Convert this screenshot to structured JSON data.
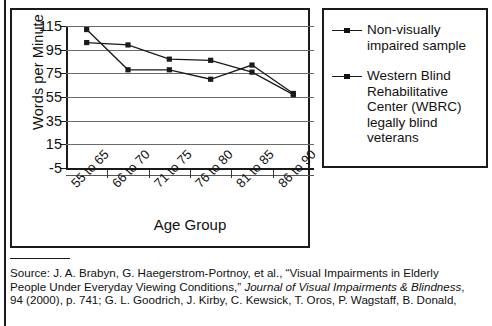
{
  "chart_data": {
    "type": "line",
    "title": "",
    "xlabel": "Age Group",
    "ylabel": "Words per Minute",
    "categories": [
      "55 to 65",
      "66 to 70",
      "71 to 75",
      "76 to 80",
      "81 to 85",
      "86 to 90"
    ],
    "yticks": [
      115,
      95,
      75,
      55,
      35,
      15,
      -5
    ],
    "ylim": [
      -5,
      115
    ],
    "grid": true,
    "legend_position": "right",
    "series": [
      {
        "name": "Non-visually impaired sample",
        "values": [
          112,
          78,
          78,
          70,
          82,
          58
        ]
      },
      {
        "name": "Western Blind Rehabilitative Center (WBRC) legally blind veterans",
        "values": [
          101,
          99,
          87,
          86,
          76,
          57
        ]
      }
    ]
  },
  "chart": {
    "y_axis_title": "Words per Minute",
    "x_axis_title": "Age Group",
    "y_tick_labels": [
      "115",
      "95",
      "75",
      "55",
      "35",
      "15",
      "-5"
    ],
    "x_tick_labels": [
      "55 to 65",
      "66 to 70",
      "71 to 75",
      "76 to 80",
      "81 to 85",
      "86 to 90"
    ],
    "line_color": "#1a1a1a",
    "grid_color": "#6a6a6a"
  },
  "legend": {
    "entries": [
      {
        "label": "Non-visually\nimpaired sample",
        "line1": "Non-visually",
        "line2": "impaired sample"
      },
      {
        "label": "Western Blind Rehabilitative Center (WBRC) legally blind veterans",
        "line1": "Western Blind",
        "line2": "Rehabilitative",
        "line3": "Center (WBRC)",
        "line4": "legally blind",
        "line5": "veterans"
      }
    ]
  },
  "source": {
    "line1_a": "Source: J. A. Brabyn, G. Haegerstrom-Portnoy, et al., “Visual Impairments in Elderly",
    "line2_a": "People Under Everyday Viewing Conditions,” ",
    "line2_italic": "Journal of Visual Impairments & Blindness",
    "line2_b": ",",
    "line3_a": "94 (2000), p. 741; G. L. Goodrich, J. Kirby, C. Kewsick, T. Oros, P. Wagstaff, B. Donald,"
  }
}
